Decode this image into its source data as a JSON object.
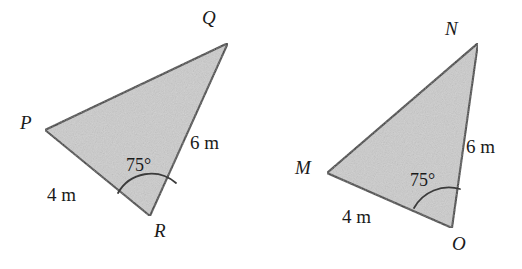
{
  "figure": {
    "kind": "geometry-diagram",
    "background_color": "#ffffff",
    "fill_color": "#cccccc",
    "stroke_color": "#3b3b3b",
    "text_color": "#1a1a1a",
    "triangles": [
      {
        "id": "pqr",
        "name": "triangle-pqr",
        "vertices": [
          {
            "name": "P",
            "label": "P",
            "x": 45,
            "y": 130,
            "label_x": 20,
            "label_y": 113
          },
          {
            "name": "Q",
            "label": "Q",
            "x": 228,
            "y": 43,
            "label_x": 202,
            "label_y": 8
          },
          {
            "name": "R",
            "label": "R",
            "x": 150,
            "y": 216,
            "label_x": 154,
            "label_y": 221
          }
        ],
        "points": "45,130 228,43 150,216",
        "sides": [
          {
            "name": "side-pr",
            "label": "4 m",
            "label_x": 47,
            "label_y": 185
          },
          {
            "name": "side-qr",
            "label": "6 m",
            "label_x": 190,
            "label_y": 133
          }
        ],
        "angle": {
          "name": "angle-r",
          "label": "75°",
          "label_x": 126,
          "label_y": 156,
          "arc_path": "M 118 193 A 38 38 0 0 1 176 183"
        }
      },
      {
        "id": "mno",
        "name": "triangle-mno",
        "vertices": [
          {
            "name": "M",
            "label": "M",
            "x": 327,
            "y": 173,
            "label_x": 295,
            "label_y": 158
          },
          {
            "name": "N",
            "label": "N",
            "x": 478,
            "y": 43,
            "label_x": 445,
            "label_y": 19
          },
          {
            "name": "O",
            "label": "O",
            "x": 452,
            "y": 228,
            "label_x": 452,
            "label_y": 234
          }
        ],
        "points": "327,173 478,43 452,228",
        "sides": [
          {
            "name": "side-mo",
            "label": "4 m",
            "label_x": 342,
            "label_y": 207
          },
          {
            "name": "side-no",
            "label": "6 m",
            "label_x": 466,
            "label_y": 137
          }
        ],
        "angle": {
          "name": "angle-o",
          "label": "75°",
          "label_x": 410,
          "label_y": 171,
          "arc_path": "M 414 208 A 40 40 0 0 1 460 189"
        }
      }
    ]
  }
}
